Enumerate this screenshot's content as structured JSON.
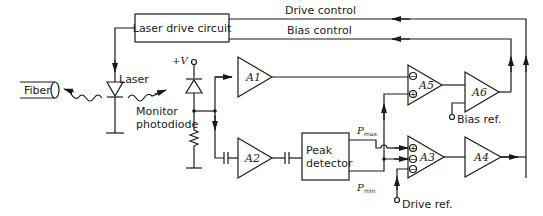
{
  "diagram": {
    "blocks": {
      "laser_drive": "Laser drive circuit",
      "peak_detector_line1": "Peak",
      "peak_detector_line2": "detector",
      "fiber": "Fiber"
    },
    "labels": {
      "drive_control": "Drive control",
      "bias_control": "Bias control",
      "laser": "Laser",
      "monitor_line1": "Monitor",
      "monitor_line2": "photodiode",
      "supply": "+V",
      "bias_ref": "Bias ref.",
      "drive_ref": "Drive ref.",
      "pmax_p": "P",
      "pmax_sub": "max",
      "pmin_p": "P",
      "pmin_sub": "min"
    },
    "amplifiers": {
      "a1": "A1",
      "a2": "A2",
      "a3": "A3",
      "a4": "A4",
      "a5": "A5",
      "a6": "A6"
    },
    "signs": {
      "a5_top": "−",
      "a5_bottom": "+",
      "a3_top": "+",
      "a3_mid": "−",
      "a3_bottom": "−"
    }
  }
}
